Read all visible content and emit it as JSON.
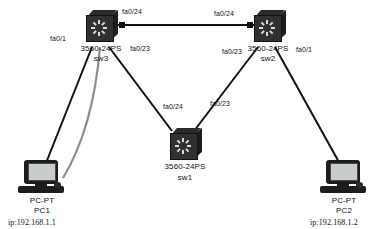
{
  "diagram": {
    "title": "",
    "background": "#ffffff",
    "line_color": "#111111",
    "highlight_line_color": "#8c8c8c"
  },
  "devices": [
    {
      "id": "sw3",
      "icon": "switch-icon",
      "model": "3560-24PS",
      "name": "sw3",
      "x": 84,
      "y": 10
    },
    {
      "id": "sw2",
      "icon": "switch-icon",
      "model": "3560-24PS",
      "name": "sw2",
      "x": 252,
      "y": 10
    },
    {
      "id": "sw1",
      "icon": "switch-icon",
      "model": "3560-24PS",
      "name": "sw1",
      "x": 168,
      "y": 128
    },
    {
      "id": "pc1",
      "icon": "pc-icon",
      "model": "PC-PT",
      "name": "PC1",
      "ip": "ip:192.168.1.1",
      "x": 18,
      "y": 160
    },
    {
      "id": "pc2",
      "icon": "pc-icon",
      "model": "PC-PT",
      "name": "PC2",
      "ip": "ip:192.168.1.2",
      "x": 320,
      "y": 160
    }
  ],
  "port_labels": {
    "sw3_top_trunk": "fa0/24",
    "sw2_top_trunk": "fa0/24",
    "sw3_to_pc1": "fa0/1",
    "sw3_to_sw1": "fa0/23",
    "sw1_to_sw3": "fa0/24",
    "sw1_to_sw2": "fa0/23",
    "sw2_to_sw1": "fa0/23",
    "sw2_to_pc2": "fa0/1"
  },
  "links": [
    {
      "from": "sw3",
      "to": "sw2",
      "style": "solid"
    },
    {
      "from": "sw3",
      "to": "sw1",
      "style": "solid"
    },
    {
      "from": "sw2",
      "to": "sw1",
      "style": "solid"
    },
    {
      "from": "sw3",
      "to": "pc1",
      "style": "solid"
    },
    {
      "from": "sw3",
      "to": "pc1",
      "style": "highlight"
    },
    {
      "from": "sw2",
      "to": "pc2",
      "style": "solid"
    }
  ]
}
